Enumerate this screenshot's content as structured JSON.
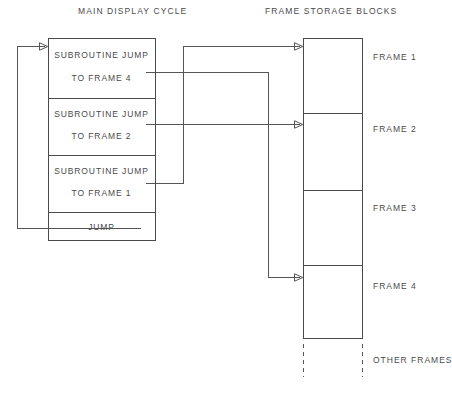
{
  "diagram": {
    "headings": {
      "left": "MAIN DISPLAY CYCLE",
      "right": "FRAME STORAGE BLOCKS"
    },
    "main_display_cycle": {
      "cells": [
        {
          "line1": "SUBROUTINE JUMP",
          "line2": "TO FRAME 4"
        },
        {
          "line1": "SUBROUTINE JUMP",
          "line2": "TO FRAME 2"
        },
        {
          "line1": "SUBROUTINE JUMP",
          "line2": "TO FRAME 1"
        },
        {
          "line1": "JUMP",
          "line2": ""
        }
      ]
    },
    "frame_storage_blocks": {
      "labels": [
        "FRAME 1",
        "FRAME 2",
        "FRAME 3",
        "FRAME 4",
        "OTHER FRAMES"
      ]
    },
    "caption": "",
    "colors": {
      "stroke": "#4a4a4a",
      "wire": "#555555",
      "text": "#4a4a4a",
      "background": "#ffffff"
    }
  }
}
